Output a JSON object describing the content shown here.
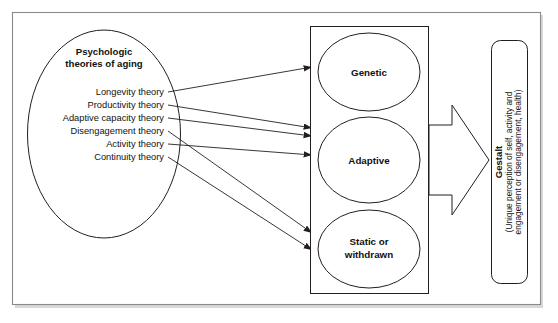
{
  "diagram": {
    "source_ellipse": {
      "title_line1": "Psychologic",
      "title_line2": "theories of aging",
      "theories": [
        {
          "label": "Longevity theory",
          "target": "Genetic"
        },
        {
          "label": "Productivity theory",
          "target": "Adaptive"
        },
        {
          "label": "Adaptive capacity theory",
          "target": "Adaptive"
        },
        {
          "label": "Disengagement theory",
          "target": "Static or withdrawn"
        },
        {
          "label": "Activity theory",
          "target": "Adaptive"
        },
        {
          "label": "Continuity theory",
          "target": "Static or withdrawn"
        }
      ]
    },
    "outcome_group": {
      "nodes": [
        {
          "label_line1": "Genetic",
          "label_line2": ""
        },
        {
          "label_line1": "Adaptive",
          "label_line2": ""
        },
        {
          "label_line1": "Static or",
          "label_line2": "withdrawn"
        }
      ]
    },
    "flow_arrow": {
      "name": "block-arrow-right",
      "direction": "right"
    },
    "gestalt": {
      "title": "Gestalt",
      "description_line1": "(Unique perception of self, activity and",
      "description_line2": "engagement or disengagement, health)"
    },
    "colors": {
      "stroke": "#231f20",
      "frame": "#8a8a8a",
      "background": "#ffffff",
      "text": "#111111"
    }
  }
}
